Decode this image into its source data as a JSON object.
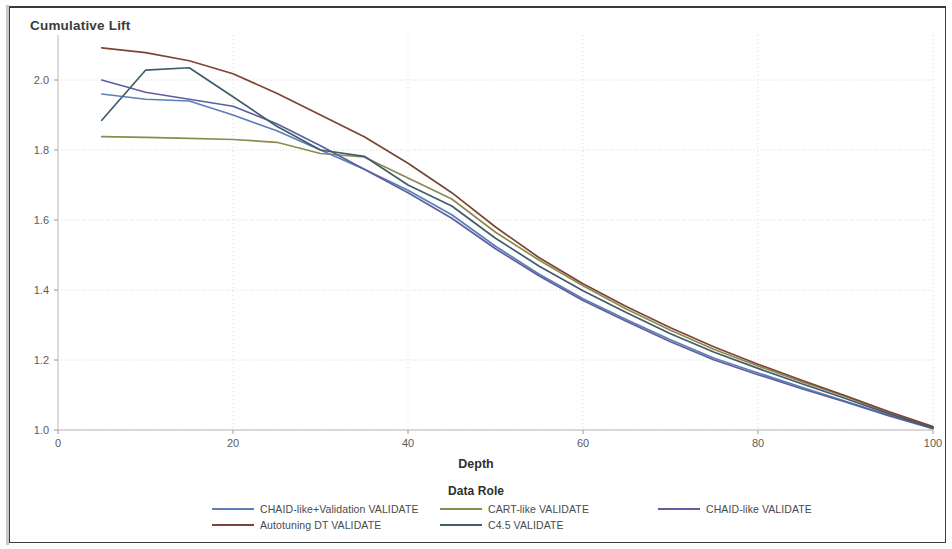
{
  "chart_data": {
    "type": "line",
    "title": "Cumulative Lift",
    "xlabel": "Depth",
    "ylabel": "Cumulative Lift",
    "legend_title": "Data Role",
    "legend_position": "bottom",
    "grid": true,
    "xlim": [
      0,
      100
    ],
    "ylim": [
      1.0,
      2.1
    ],
    "x_ticks": [
      "0",
      "20",
      "40",
      "60",
      "80",
      "100"
    ],
    "x_tick_values": [
      0,
      20,
      40,
      60,
      80,
      100
    ],
    "y_ticks": [
      "1.0",
      "1.2",
      "1.4",
      "1.6",
      "1.8",
      "2.0"
    ],
    "y_tick_values": [
      1.0,
      1.2,
      1.4,
      1.6,
      1.8,
      2.0
    ],
    "x": [
      5,
      10,
      15,
      20,
      25,
      30,
      35,
      40,
      45,
      50,
      55,
      60,
      65,
      70,
      75,
      80,
      85,
      90,
      95,
      100
    ],
    "series": [
      {
        "name": "CHAID-like+Validation VALIDATE",
        "color": "#5b7fb5",
        "values": [
          1.96,
          1.945,
          1.94,
          1.9,
          1.855,
          1.8,
          1.745,
          1.685,
          1.615,
          1.525,
          1.445,
          1.375,
          1.315,
          1.258,
          1.205,
          1.163,
          1.122,
          1.082,
          1.042,
          1.005
        ]
      },
      {
        "name": "CART-like VALIDATE",
        "color": "#8d8a4e",
        "values": [
          1.838,
          1.836,
          1.833,
          1.83,
          1.822,
          1.79,
          1.78,
          1.72,
          1.66,
          1.565,
          1.485,
          1.412,
          1.345,
          1.285,
          1.23,
          1.183,
          1.138,
          1.096,
          1.05,
          1.008
        ]
      },
      {
        "name": "CHAID-like VALIDATE",
        "color": "#5e5f9e",
        "values": [
          2.0,
          1.965,
          1.945,
          1.925,
          1.875,
          1.812,
          1.745,
          1.678,
          1.605,
          1.518,
          1.44,
          1.37,
          1.31,
          1.252,
          1.2,
          1.158,
          1.118,
          1.08,
          1.04,
          1.004
        ]
      },
      {
        "name": "Autotuning DT VALIDATE",
        "color": "#7d4434",
        "values": [
          2.092,
          2.078,
          2.055,
          2.018,
          1.962,
          1.9,
          1.838,
          1.762,
          1.678,
          1.58,
          1.492,
          1.418,
          1.352,
          1.292,
          1.237,
          1.188,
          1.142,
          1.098,
          1.052,
          1.01
        ]
      },
      {
        "name": "C4.5 VALIDATE",
        "color": "#3f5d6b",
        "values": [
          1.885,
          2.028,
          2.035,
          1.952,
          1.868,
          1.8,
          1.782,
          1.7,
          1.64,
          1.548,
          1.468,
          1.398,
          1.335,
          1.275,
          1.222,
          1.176,
          1.132,
          1.09,
          1.046,
          1.006
        ]
      }
    ]
  },
  "legend": {
    "title": "Data Role",
    "row1": [
      {
        "label": "CHAID-like+Validation VALIDATE",
        "color": "#5b7fb5"
      },
      {
        "label": "CART-like VALIDATE",
        "color": "#8d8a4e"
      },
      {
        "label": "CHAID-like VALIDATE",
        "color": "#5e5f9e"
      }
    ],
    "row2": [
      {
        "label": "Autotuning DT VALIDATE",
        "color": "#7d4434"
      },
      {
        "label": "C4.5 VALIDATE",
        "color": "#3f5d6b"
      }
    ]
  }
}
